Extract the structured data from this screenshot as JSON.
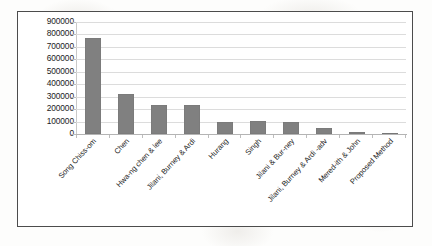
{
  "chart_data": {
    "type": "bar",
    "title": "",
    "subtitle": "",
    "xlabel": "",
    "ylabel": "",
    "ylim": [
      0,
      900000
    ],
    "ytick_step": 100000,
    "yticks": [
      "900000",
      "800000",
      "700000",
      "600000",
      "500000",
      "400000",
      "300000",
      "200000",
      "100000",
      "0"
    ],
    "grid": "horizontal",
    "legend": "none",
    "bar_color": "#808080",
    "gridline_color": "#dcdcdc",
    "frame_color": "#4c4c4c",
    "categories": [
      "Song Chiss-om",
      "Chen",
      "Hwa-ng chen & lee",
      "Jilani, Burney & Ardi",
      "Hurang",
      "Singh",
      "Jilani & Bur-ney",
      "Jilani, Burney & Ardi -adv",
      "Mered-ith & John",
      "Proposed Method"
    ],
    "values": [
      770000,
      320000,
      230000,
      230000,
      100000,
      105000,
      100000,
      45000,
      20000,
      10000
    ],
    "annotations": []
  }
}
